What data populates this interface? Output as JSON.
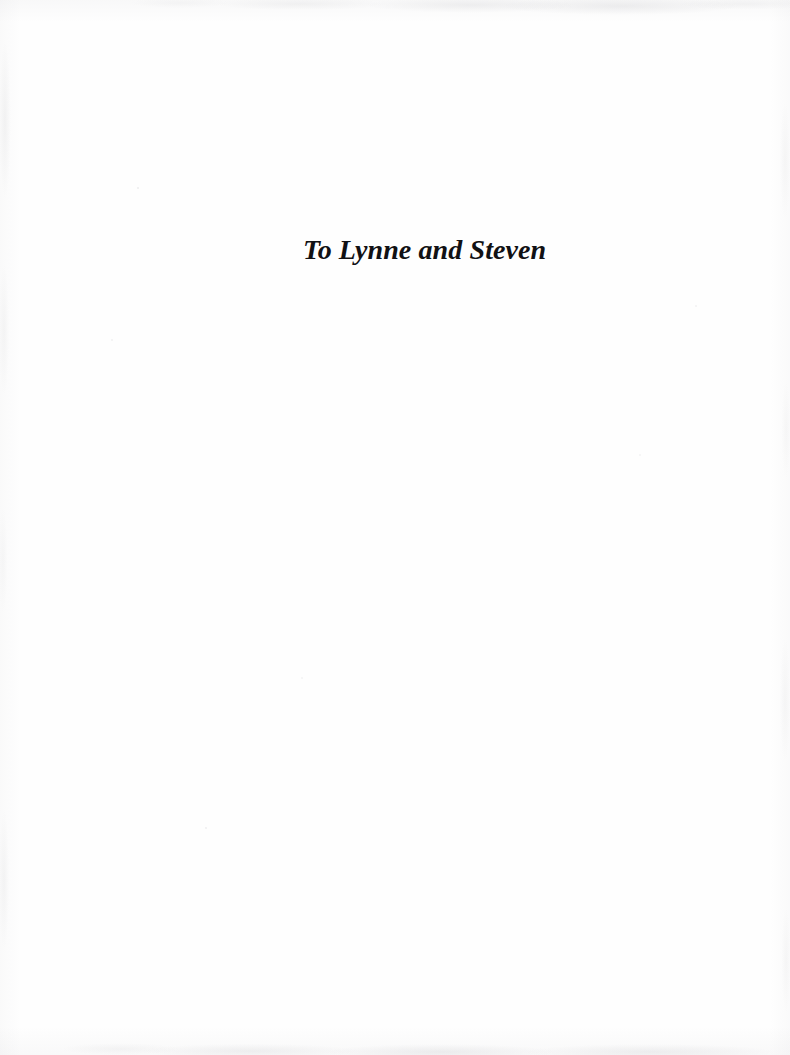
{
  "page": {
    "kind": "book-dedication-page",
    "width": 790,
    "height": 1055,
    "background_color": "#fefefe"
  },
  "dedication": {
    "text": "To Lynne and Steven",
    "color": "#111114",
    "style": "bold-italic-serif",
    "font_size_px": 28,
    "left_px": 303,
    "baseline_y_px": 262
  },
  "artifacts": {
    "top_edge": "scan-smudge-top",
    "bottom_edge": "scan-smudge-bottom",
    "left_edge": "scan-smudge-left",
    "right_edge": "scan-smudge-right",
    "speckles": "scan-speckle-field",
    "color": "#8c8c92"
  }
}
